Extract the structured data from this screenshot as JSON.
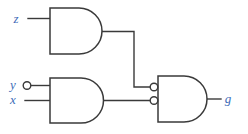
{
  "colors": {
    "background": "#ffffff",
    "wire": "#3a3a3a",
    "gate_fill": "#ffffff",
    "label_text": "#3e6cb8"
  },
  "labels": {
    "input_z": "z",
    "input_y": "y",
    "input_x": "x",
    "output_g": "g"
  },
  "gates": [
    {
      "id": "and-top",
      "type": "AND",
      "inputs": [
        "z"
      ],
      "output_to": "and-right-top-inverted-input"
    },
    {
      "id": "and-bottom-left",
      "type": "AND",
      "inputs": [
        "y",
        "x"
      ],
      "bubble_on_input": "y",
      "output_to": "and-right-bottom-inverted-input"
    },
    {
      "id": "and-right",
      "type": "AND",
      "inverted_inputs": true,
      "output": "g"
    }
  ]
}
